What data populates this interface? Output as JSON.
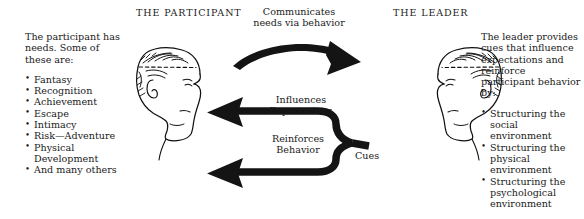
{
  "headings": {
    "participant": "THE PARTICIPANT",
    "leader": "THE LEADER"
  },
  "participant_panel": {
    "intro_lines": [
      "The participant has",
      "needs. Some of",
      "these are:"
    ],
    "items": [
      {
        "line1": "Fantasy",
        "line2": ""
      },
      {
        "line1": "Recognition",
        "line2": ""
      },
      {
        "line1": "Achievement",
        "line2": ""
      },
      {
        "line1": "Escape",
        "line2": ""
      },
      {
        "line1": "Intimacy",
        "line2": ""
      },
      {
        "line1": "Risk—Adventure",
        "line2": ""
      },
      {
        "line1": "Physical",
        "line2": "Development"
      },
      {
        "line1": "And many others",
        "line2": ""
      }
    ]
  },
  "leader_panel": {
    "intro_lines": [
      "The leader provides",
      "cues that influence",
      "expectations and",
      "reinforce",
      "participant behavior",
      "by:"
    ],
    "items": [
      {
        "line1": "Structuring the",
        "line2": "social",
        "line3": "environment"
      },
      {
        "line1": "Structuring the",
        "line2": "physical",
        "line3": "environment"
      },
      {
        "line1": "Structuring the",
        "line2": "psychological",
        "line3": "environment"
      }
    ]
  },
  "flows": {
    "communicates_line1": "Communicates",
    "communicates_line2": "needs via behavior",
    "influences_line1": "Influences",
    "influences_line2": "Expectations",
    "reinforces_line1": "Reinforces",
    "reinforces_line2": "Behavior",
    "cues": "Cues"
  },
  "figures": {
    "participant_head": "head-profile-facing-right",
    "leader_head": "head-profile-facing-left"
  },
  "colors": {
    "ink": "#1a1a1a",
    "background": "#ffffff"
  }
}
